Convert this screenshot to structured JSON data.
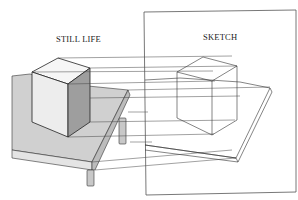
{
  "diagram": {
    "labels": {
      "still_life": "STILL LIFE",
      "sketch": "SKETCH"
    },
    "colors": {
      "line": "#333333",
      "cube_top": "#f4f4f4",
      "cube_front": "#ececec",
      "cube_side": "#9a9a9a",
      "table_top": "#d0d0d0",
      "table_edge": "#e2e2e2",
      "table_leg": "#c8c8c8",
      "frame": "#555555"
    }
  }
}
